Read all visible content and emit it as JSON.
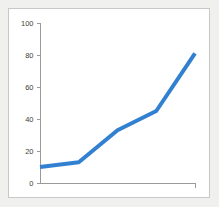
{
  "chart_data": {
    "type": "line",
    "title": "",
    "subtitle": "",
    "xlabel": "",
    "ylabel": "",
    "x": [
      1,
      2,
      3,
      4,
      5
    ],
    "categories": [
      "1",
      "2",
      "3",
      "4",
      "5"
    ],
    "series": [
      {
        "name": "Series 1",
        "values": [
          10,
          13,
          33,
          45,
          81
        ],
        "color": "#3281d0",
        "line_width": 4
      }
    ],
    "ylim": [
      0,
      100
    ],
    "xlim": [
      1,
      5
    ],
    "yticks": [
      0,
      20,
      40,
      60,
      80,
      100
    ],
    "ytick_labels": [
      "0",
      "20",
      "40",
      "60",
      "80",
      "100"
    ],
    "xticks": [],
    "xtick_labels": [],
    "grid": false,
    "legend": false,
    "legend_position": "none",
    "annotations": []
  },
  "style": {
    "page_background": "#f0f0ef",
    "card_background": "#ffffff",
    "card_border": "#c8c8c8",
    "axis_color": "#9a9a9a",
    "tick_label_color": "#3d3d3d",
    "series_color": "#3281d0"
  },
  "geometry": {
    "plot_left": 31,
    "plot_right": 186,
    "plot_top": 14,
    "plot_bottom": 174,
    "tick_length": 4
  }
}
